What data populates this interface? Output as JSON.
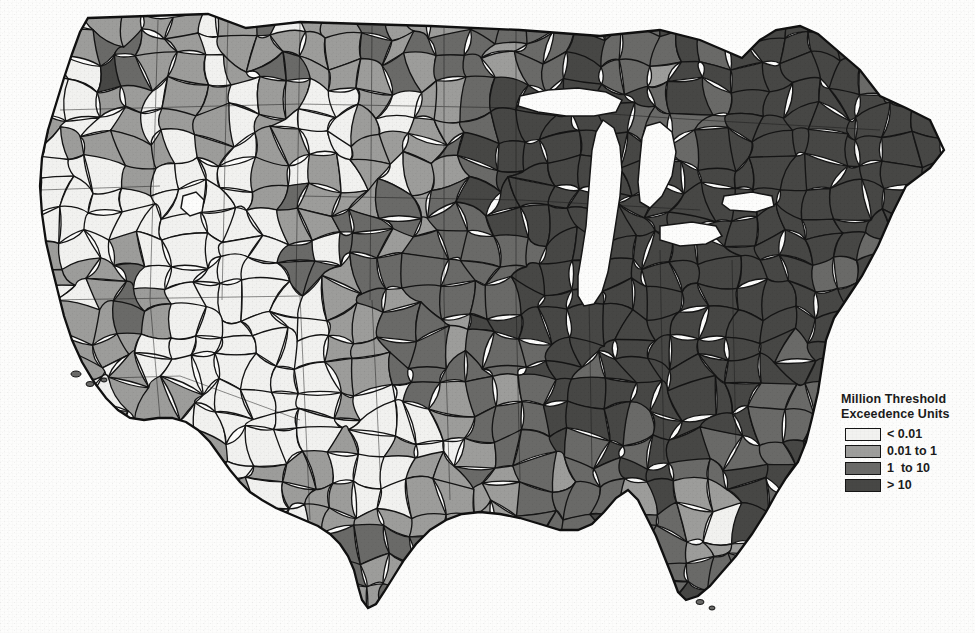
{
  "document": {
    "kind": "scanned-choropleth-map",
    "region_title": "Contiguous United States",
    "background_color": "#fdfdfc",
    "border_color": "#151515"
  },
  "legend": {
    "title_line1": "Million Threshold",
    "title_line2": "Exceedence Units",
    "classes": [
      {
        "label": "< 0.01",
        "color": "#f2f2f0",
        "class_key": "c1"
      },
      {
        "label": "0.01 to 1",
        "color": "#9d9d9b",
        "class_key": "c2"
      },
      {
        "label": "1  to 10",
        "color": "#6a6a68",
        "class_key": "c3"
      },
      {
        "label": "> 10",
        "color": "#474745",
        "class_key": "c4"
      }
    ]
  },
  "chart_data": {
    "type": "choropleth",
    "title": "Million Threshold Exceedence Units",
    "xlabel": "",
    "ylabel": "",
    "grid": false,
    "legend_position": "lower-right",
    "classification": "graduated 4-class grayscale",
    "class_breaks": [
      "< 0.01",
      "0.01 to 1",
      "1 to 10",
      "> 10"
    ],
    "class_colors": [
      "#f2f2f0",
      "#9d9d9b",
      "#6a6a68",
      "#474745"
    ],
    "unit": "Million Threshold Exceedence Units",
    "geography": "United States watershed (HUC) polygons, contiguous 48 states",
    "regional_summary": [
      {
        "region": "Pacific Northwest (WA, OR, ID)",
        "dominant_class": "0.01 to 1",
        "notes": "Puget Sound and Willamette dark (> 10); interior basins light"
      },
      {
        "region": "California Central Valley",
        "dominant_class": "1 to 10",
        "notes": "Sacramento and San Joaquin basins dark"
      },
      {
        "region": "Great Basin / Nevada / Utah",
        "dominant_class": "< 0.01",
        "notes": "Large contiguous white (lowest) area"
      },
      {
        "region": "Desert Southwest (AZ, NM)",
        "dominant_class": "< 0.01",
        "notes": "Mixed white with some 0.01 to 1 along lower Colorado and Rio Grande"
      },
      {
        "region": "Northern Plains (MT, ND, SD, WY)",
        "dominant_class": "0.01 to 1",
        "notes": "Mid-gray with scattered 1 to 10 basins"
      },
      {
        "region": "Central Plains (NE, KS, OK)",
        "dominant_class": "1 to 10",
        "notes": "Transition to darker values eastward"
      },
      {
        "region": "Upper Midwest (MN, WI, MI, IA)",
        "dominant_class": "> 10",
        "notes": "Great Lakes water rendered white"
      },
      {
        "region": "Ohio / Mississippi Valley (IL, IN, OH, MO, KY, TN)",
        "dominant_class": "> 10",
        "notes": "Most intensely shaded region of the map"
      },
      {
        "region": "Northeast (NY, PA, NJ, NE states)",
        "dominant_class": "> 10",
        "notes": "Coastal and interior basins dark; some 0.01 to 1 in northern Maine"
      },
      {
        "region": "Mid-Atlantic (VA, NC, SC, MD)",
        "dominant_class": "1 to 10",
        "notes": "Chesapeake and Piedmont basins dark"
      },
      {
        "region": "Deep South (MS, AL, GA, LA, AR)",
        "dominant_class": "1 to 10",
        "notes": "Mixed 1 to 10 and > 10"
      },
      {
        "region": "Texas",
        "dominant_class": "1 to 10",
        "notes": "East Texas dark; west Texas light to mid-gray"
      },
      {
        "region": "Florida",
        "dominant_class": "0.01 to 1",
        "notes": "Peninsula mid-gray with interior < 0.01 basins; panhandle darker"
      }
    ],
    "class_share_estimate_pct": [
      {
        "class": "< 0.01",
        "share": 16
      },
      {
        "class": "0.01 to 1",
        "share": 26
      },
      {
        "class": "1 to 10",
        "share": 26
      },
      {
        "class": "> 10",
        "share": 32
      }
    ]
  }
}
